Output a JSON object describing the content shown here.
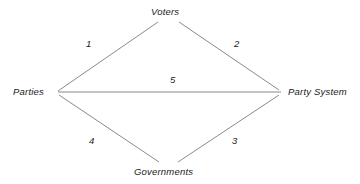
{
  "diagram": {
    "title": "",
    "background_color": "#ffffff",
    "line_color": "#8a8a8a",
    "text_color": "#1a1a1a",
    "nodes": [
      {
        "id": "voters",
        "label": "Voters",
        "position": "top"
      },
      {
        "id": "parties",
        "label": "Parties",
        "position": "left"
      },
      {
        "id": "party-system",
        "label": "Party System",
        "position": "right"
      },
      {
        "id": "governments",
        "label": "Governments",
        "position": "bottom"
      }
    ],
    "edges": [
      {
        "id": "edge-1",
        "label": "1",
        "from": "parties",
        "to": "voters"
      },
      {
        "id": "edge-2",
        "label": "2",
        "from": "voters",
        "to": "party-system"
      },
      {
        "id": "edge-3",
        "label": "3",
        "from": "governments",
        "to": "party-system"
      },
      {
        "id": "edge-4",
        "label": "4",
        "from": "parties",
        "to": "governments"
      },
      {
        "id": "edge-5",
        "label": "5",
        "from": "parties",
        "to": "party-system"
      }
    ]
  }
}
